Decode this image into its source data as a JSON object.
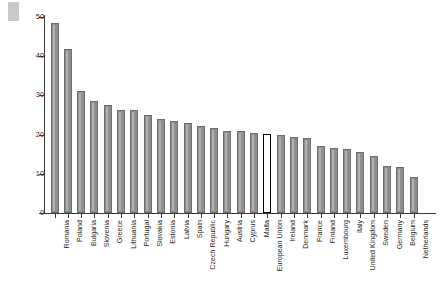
{
  "chart_data": {
    "type": "bar",
    "title": "",
    "xlabel": "",
    "ylabel": "Percentage of employment in bad jobs (%)",
    "ylim": [
      0,
      50
    ],
    "yticks": [
      0,
      10,
      20,
      30,
      40,
      50
    ],
    "grid": false,
    "legend": null,
    "highlight_category": "European Union",
    "bar_fill_color": "#8f8f8f",
    "bar_border_color": "#6d6d6d",
    "highlight_fill_color": "#ffffff",
    "highlight_border_color": "#000000",
    "categories": [
      "Romania",
      "Poland",
      "Bulgaria",
      "Slovenia",
      "Greece",
      "Lithuania",
      "Portugal",
      "Slovakia",
      "Estonia",
      "Latvia",
      "Spain",
      "Czech Republic",
      "Hungary",
      "Austria",
      "Cyprus",
      "Malta",
      "European Union",
      "Ireland",
      "Denmark",
      "France",
      "Finland",
      "Luxembourg",
      "Italy",
      "United Kingdom",
      "Sweden",
      "Germany",
      "Belgium",
      "Netherlands"
    ],
    "values": [
      48.5,
      41.8,
      31.2,
      28.6,
      27.6,
      26.4,
      26.4,
      25.0,
      24.1,
      23.5,
      23.0,
      22.2,
      21.8,
      21.0,
      20.8,
      20.4,
      20.2,
      19.8,
      19.5,
      19.2,
      17.0,
      16.6,
      16.3,
      15.6,
      14.5,
      11.9,
      11.7,
      9.3
    ]
  },
  "axis": {
    "y_title": "Percentage of employment in bad jobs (%)",
    "y_tick_labels": [
      "0",
      "10",
      "20",
      "30",
      "40",
      "50"
    ]
  }
}
